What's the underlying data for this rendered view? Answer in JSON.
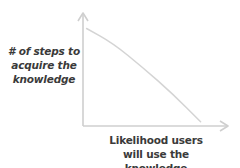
{
  "chart_data": {
    "type": "line",
    "title": "",
    "xlabel": "Likelihood users will use the knowledge",
    "ylabel": "# of steps to acquire the knowledge",
    "x_ticks": [],
    "y_ticks": [],
    "grid": false,
    "legend": null,
    "series": [
      {
        "name": "relationship",
        "description": "decreasing, slightly concave curve",
        "x": [
          0.03,
          0.25,
          0.5,
          0.75,
          0.98
        ],
        "values": [
          0.92,
          0.78,
          0.55,
          0.3,
          0.04
        ]
      }
    ],
    "xlim": [
      0,
      1
    ],
    "ylim": [
      0,
      1
    ]
  },
  "labels": {
    "y_axis_lines": [
      "# of steps to",
      "acquire the",
      "knowledge"
    ],
    "x_axis_lines": [
      "Likelihood users",
      "will use the knowledge"
    ]
  },
  "colors": {
    "axis": "#cfcfcf",
    "line": "#d4d4d4",
    "text": "#3a3a3a",
    "background": "#ffffff"
  }
}
